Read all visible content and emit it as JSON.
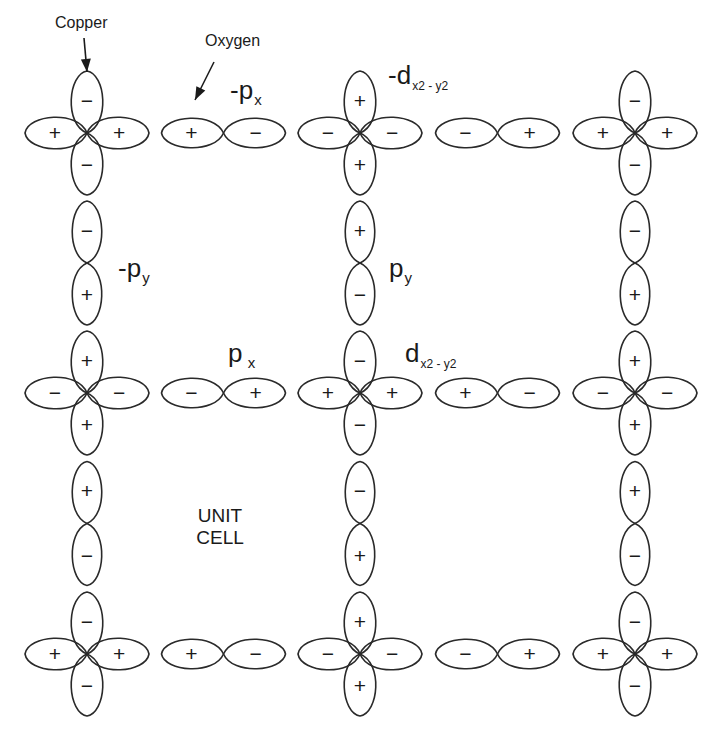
{
  "labels": {
    "copper": "Copper",
    "oxygen": "Oxygen",
    "unit_cell_line1": "UNIT",
    "unit_cell_line2": "CELL",
    "neg_px": {
      "main": "-p",
      "sub": "x"
    },
    "neg_dx2y2": {
      "main": "-d",
      "sub": "x2 - y2"
    },
    "neg_py": {
      "main": "-p",
      "sub": "y"
    },
    "py": {
      "main": "p",
      "sub": "y"
    },
    "px": {
      "main": "p",
      "sub": " x"
    },
    "dx2y2": {
      "main": "d",
      "sub": "x2 - y2"
    }
  },
  "style": {
    "stroke": "#2a2a2a",
    "text": "#1a1a1a",
    "background": "#ffffff"
  },
  "lattice": {
    "columns_x": [
      87,
      360,
      635
    ],
    "rows_y": [
      133,
      393,
      654
    ],
    "copper_lobe_length": 62,
    "copper_lobe_halfwidth": 15,
    "oxygen_lobe_length": 62,
    "oxygen_lobe_halfwidth": 14
  },
  "copper_atoms": [
    {
      "row": 0,
      "col": 0,
      "orbital": "dx2-y2",
      "top": "−",
      "left": "+",
      "right": "+",
      "bottom": "−"
    },
    {
      "row": 0,
      "col": 1,
      "orbital": "-dx2-y2",
      "top": "+",
      "left": "−",
      "right": "−",
      "bottom": "+"
    },
    {
      "row": 0,
      "col": 2,
      "orbital": "dx2-y2",
      "top": "−",
      "left": "+",
      "right": "+",
      "bottom": "−"
    },
    {
      "row": 1,
      "col": 0,
      "orbital": "-dx2-y2",
      "top": "+",
      "left": "−",
      "right": "−",
      "bottom": "+"
    },
    {
      "row": 1,
      "col": 1,
      "orbital": "dx2-y2",
      "top": "−",
      "left": "+",
      "right": "+",
      "bottom": "−"
    },
    {
      "row": 1,
      "col": 2,
      "orbital": "-dx2-y2",
      "top": "+",
      "left": "−",
      "right": "−",
      "bottom": "+"
    },
    {
      "row": 2,
      "col": 0,
      "orbital": "dx2-y2",
      "top": "−",
      "left": "+",
      "right": "+",
      "bottom": "−"
    },
    {
      "row": 2,
      "col": 1,
      "orbital": "-dx2-y2",
      "top": "+",
      "left": "−",
      "right": "−",
      "bottom": "+"
    },
    {
      "row": 2,
      "col": 2,
      "orbital": "dx2-y2",
      "top": "−",
      "left": "+",
      "right": "+",
      "bottom": "−"
    }
  ],
  "oxygen_horizontal": [
    {
      "row": 0,
      "between": [
        0,
        1
      ],
      "left": "+",
      "right": "−"
    },
    {
      "row": 0,
      "between": [
        1,
        2
      ],
      "left": "−",
      "right": "+"
    },
    {
      "row": 1,
      "between": [
        0,
        1
      ],
      "left": "−",
      "right": "+"
    },
    {
      "row": 1,
      "between": [
        1,
        2
      ],
      "left": "+",
      "right": "−"
    },
    {
      "row": 2,
      "between": [
        0,
        1
      ],
      "left": "+",
      "right": "−"
    },
    {
      "row": 2,
      "between": [
        1,
        2
      ],
      "left": "−",
      "right": "+"
    }
  ],
  "oxygen_vertical": [
    {
      "col": 0,
      "between": [
        0,
        1
      ],
      "top": "−",
      "bottom": "+"
    },
    {
      "col": 1,
      "between": [
        0,
        1
      ],
      "top": "+",
      "bottom": "−"
    },
    {
      "col": 2,
      "between": [
        0,
        1
      ],
      "top": "−",
      "bottom": "+"
    },
    {
      "col": 0,
      "between": [
        1,
        2
      ],
      "top": "+",
      "bottom": "−"
    },
    {
      "col": 1,
      "between": [
        1,
        2
      ],
      "top": "−",
      "bottom": "+"
    },
    {
      "col": 2,
      "between": [
        1,
        2
      ],
      "top": "+",
      "bottom": "−"
    }
  ],
  "arrows": [
    {
      "name": "copper-arrow",
      "from": [
        84,
        38
      ],
      "to": [
        87,
        72
      ]
    },
    {
      "name": "oxygen-arrow",
      "from": [
        214,
        62
      ],
      "to": [
        195,
        100
      ]
    }
  ]
}
